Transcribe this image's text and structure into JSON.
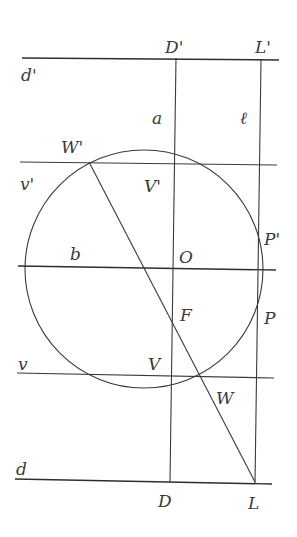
{
  "diagram": {
    "colors": {
      "stroke": "#3a3a3a",
      "background": "#ffffff"
    },
    "circle": {
      "center_label": "O",
      "cx": 144,
      "cy": 269,
      "r": 119
    },
    "lines": {
      "d_prime": {
        "label": "d'",
        "x1": 22,
        "y1": 58,
        "x2": 279,
        "y2": 60
      },
      "v_prime": {
        "label": "v'",
        "x1": 20,
        "y1": 162,
        "x2": 277,
        "y2": 165
      },
      "b": {
        "label": "b",
        "x1": 18,
        "y1": 266,
        "x2": 276,
        "y2": 270
      },
      "v": {
        "label": "v",
        "x1": 17,
        "y1": 373,
        "x2": 274,
        "y2": 378
      },
      "d": {
        "label": "d",
        "x1": 15,
        "y1": 479,
        "x2": 272,
        "y2": 484
      },
      "a": {
        "label": "a",
        "x1": 176,
        "y1": 58,
        "x2": 170,
        "y2": 482
      },
      "l": {
        "label": "ℓ",
        "x1": 261,
        "y1": 60,
        "x2": 255,
        "y2": 484
      },
      "chord": {
        "label": "W'L",
        "x1": 89,
        "y1": 162,
        "x2": 255,
        "y2": 482
      }
    },
    "labels": [
      {
        "text": "D'",
        "x": 165,
        "y": 53
      },
      {
        "text": "L'",
        "x": 255,
        "y": 53
      },
      {
        "text": "d'",
        "x": 21,
        "y": 81
      },
      {
        "text": "a",
        "x": 152,
        "y": 124
      },
      {
        "text": "ℓ",
        "x": 240,
        "y": 124
      },
      {
        "text": "W'",
        "x": 61,
        "y": 153
      },
      {
        "text": "v'",
        "x": 20,
        "y": 190
      },
      {
        "text": "V'",
        "x": 144,
        "y": 192
      },
      {
        "text": "P'",
        "x": 264,
        "y": 245
      },
      {
        "text": "b",
        "x": 70,
        "y": 260
      },
      {
        "text": "O",
        "x": 179,
        "y": 263
      },
      {
        "text": "F",
        "x": 180,
        "y": 321
      },
      {
        "text": "P",
        "x": 264,
        "y": 324
      },
      {
        "text": "v",
        "x": 18,
        "y": 370
      },
      {
        "text": "V",
        "x": 148,
        "y": 370
      },
      {
        "text": "W",
        "x": 216,
        "y": 404
      },
      {
        "text": "d",
        "x": 16,
        "y": 475
      },
      {
        "text": "D",
        "x": 158,
        "y": 507
      },
      {
        "text": "L",
        "x": 248,
        "y": 509
      }
    ]
  }
}
